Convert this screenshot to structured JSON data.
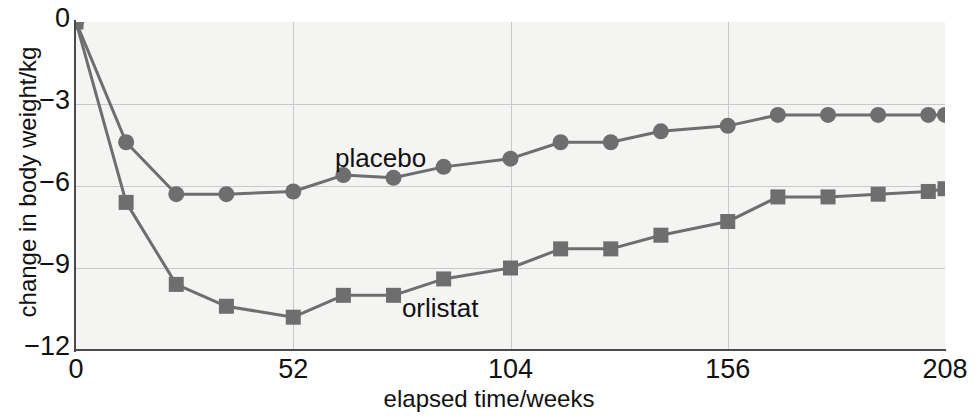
{
  "chart_data": {
    "type": "line",
    "title": "",
    "xlabel": "elapsed time/weeks",
    "ylabel": "change in body weight/kg",
    "xlim": [
      0,
      208
    ],
    "ylim": [
      -12,
      0
    ],
    "xticks": [
      0,
      52,
      104,
      156,
      208
    ],
    "yticks": [
      0,
      -3,
      -6,
      -9,
      -12
    ],
    "ytick_labels": [
      "0",
      "−3",
      "−6",
      "−9",
      "−12"
    ],
    "xtick_labels": [
      "0",
      "52",
      "104",
      "156",
      "208"
    ],
    "grid": true,
    "legend": "inline-annotations",
    "x": [
      0,
      12,
      24,
      36,
      52,
      64,
      76,
      88,
      104,
      116,
      128,
      140,
      156,
      168,
      180,
      192,
      204,
      208
    ],
    "series": [
      {
        "name": "placebo",
        "marker": "circle",
        "color": "#6e6e6e",
        "values": [
          0,
          -4.4,
          -6.3,
          -6.3,
          -6.2,
          -5.6,
          -5.7,
          -5.3,
          -5.0,
          -4.4,
          -4.4,
          -4.0,
          -3.8,
          -3.4,
          -3.4,
          -3.4,
          -3.4,
          -3.4
        ]
      },
      {
        "name": "orlistat",
        "marker": "square",
        "color": "#6e6e6e",
        "values": [
          0,
          -6.6,
          -9.6,
          -10.4,
          -10.8,
          -10.0,
          -10.0,
          -9.4,
          -9.0,
          -8.3,
          -8.3,
          -7.8,
          -7.3,
          -6.4,
          -6.4,
          -6.3,
          -6.2,
          -6.1
        ]
      }
    ],
    "annotations": [
      {
        "text": "placebo",
        "x": 62,
        "y": -5.0
      },
      {
        "text": "orlistat",
        "x": 78,
        "y": -10.5
      }
    ]
  },
  "axes": {
    "y_label": "change in body weight/kg",
    "x_label": "elapsed time/weeks"
  },
  "labels": {
    "placebo": "placebo",
    "orlistat": "orlistat"
  }
}
